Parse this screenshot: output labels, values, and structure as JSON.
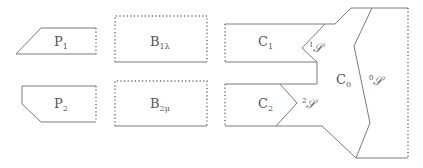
{
  "diagram": {
    "colors": {
      "stroke": "#7a7a7a",
      "text": "#555555",
      "background": "#ffffff"
    },
    "nodes": {
      "P1": {
        "main": "P",
        "sub": "1"
      },
      "P2": {
        "main": "P",
        "sub": "2"
      },
      "B1": {
        "main": "B",
        "sub": "1λ"
      },
      "B2": {
        "main": "B",
        "sub": "2μ"
      },
      "C1": {
        "main": "C",
        "sub": "1"
      },
      "C2": {
        "main": "C",
        "sub": "2"
      },
      "C0": {
        "main": "C",
        "sub": "0"
      }
    },
    "interfaces": {
      "S1": {
        "pre": "1",
        "main": "𝒮"
      },
      "S2": {
        "pre": "2",
        "main": "𝒮"
      },
      "S0": {
        "pre": "0",
        "main": "𝒮"
      }
    }
  }
}
